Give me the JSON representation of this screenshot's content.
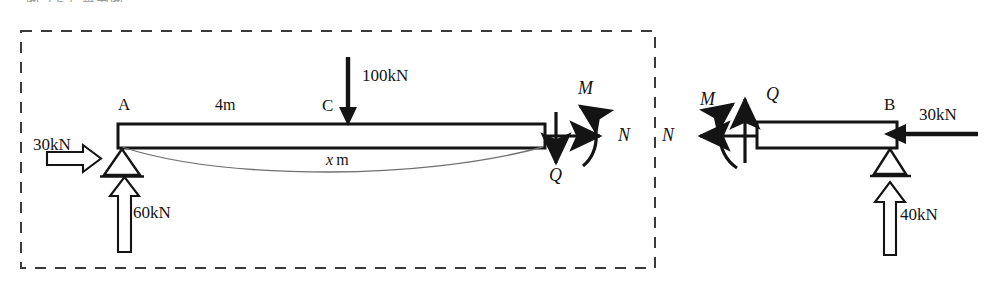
{
  "figure": {
    "title_fragment": "图（ｂ）受力图",
    "dashed_box": {
      "present": true
    },
    "left_free_body": {
      "beam": {
        "label_left": "A",
        "label_cut": "C",
        "span_dimension": "4m",
        "x_dimension_label": "x",
        "x_dimension_unit": "m"
      },
      "applied_loads": [
        {
          "name": "horizontal-load-a",
          "value": "30kN",
          "direction": "right",
          "style": "hollow"
        },
        {
          "name": "point-load-c",
          "value": "100kN",
          "direction": "down",
          "style": "solid"
        },
        {
          "name": "reaction-a",
          "value": "60kN",
          "direction": "up",
          "style": "hollow"
        }
      ],
      "internal_forces": [
        {
          "name": "axial-force",
          "symbol": "N",
          "direction": "right"
        },
        {
          "name": "shear-force",
          "symbol": "Q",
          "direction": "down"
        },
        {
          "name": "bending-moment",
          "symbol": "M",
          "direction": "counterclockwise"
        }
      ]
    },
    "right_free_body": {
      "beam": {
        "label_right": "B"
      },
      "applied_loads": [
        {
          "name": "horizontal-load-b",
          "value": "30kN",
          "direction": "left",
          "style": "solid"
        },
        {
          "name": "reaction-b",
          "value": "40kN",
          "direction": "up",
          "style": "hollow"
        }
      ],
      "internal_forces": [
        {
          "name": "axial-force",
          "symbol": "N",
          "direction": "left"
        },
        {
          "name": "shear-force",
          "symbol": "Q",
          "direction": "up"
        },
        {
          "name": "bending-moment",
          "symbol": "M",
          "direction": "clockwise"
        }
      ]
    },
    "colors": {
      "ink": "#141414",
      "dashed": "#3a3a3a",
      "paper": "#ffffff"
    }
  }
}
